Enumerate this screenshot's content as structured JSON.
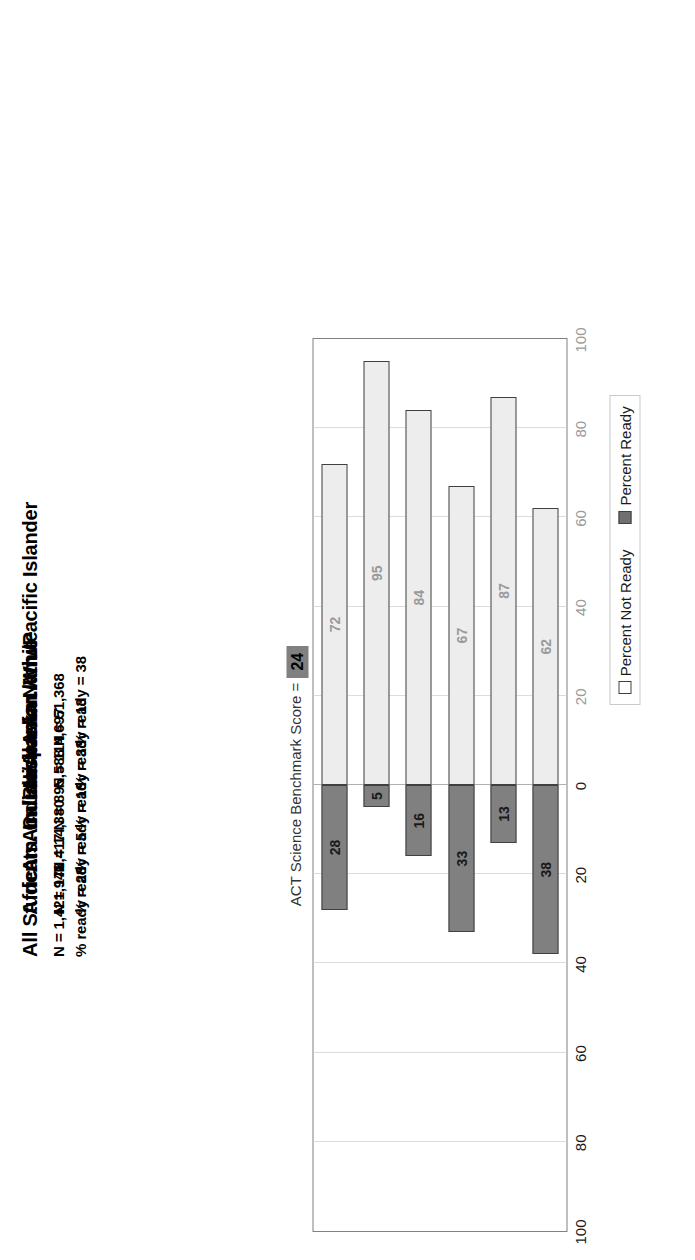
{
  "chart_title_prefix": "ACT Science Benchmark Score =",
  "benchmark_score": "24",
  "legend": {
    "not_ready": "Percent Not Ready",
    "ready": "Percent Ready"
  },
  "axis": {
    "ticks": [
      "100",
      "80",
      "60",
      "40",
      "20",
      "0",
      "20",
      "40",
      "60",
      "80",
      "100"
    ],
    "tick_values": [
      100,
      80,
      60,
      40,
      20,
      0,
      -20,
      -40,
      -60,
      -80,
      -100
    ],
    "min": -100,
    "max": 100
  },
  "groups": [
    {
      "name": "All Students",
      "n_label": "N =  1,421,941",
      "ready_label": "% ready = 28"
    },
    {
      "name": "African Am./Black",
      "n_label": "N =  178,417",
      "ready_label": "% ready = 5"
    },
    {
      "name": "Am. Indian/Alaska Native",
      "n_label": "N =  14,380",
      "ready_label": "% ready = 16"
    },
    {
      "name": "Caucasian Am./White",
      "n_label": "N =  895,588",
      "ready_label": "% ready = 33"
    },
    {
      "name": "Hispanic",
      "n_label": "N =  114,697",
      "ready_label": "% ready = 13"
    },
    {
      "name": "Asian Am./Pacific Islander",
      "n_label": "N =  51,368",
      "ready_label": "% ready = 38"
    }
  ],
  "chart_data": {
    "type": "bar",
    "xlabel": "",
    "ylabel": "Percent",
    "ylim": [
      -100,
      100
    ],
    "grid": true,
    "legend_position": "bottom-right",
    "orientation": "vertical-diverging",
    "categories": [
      "All Students",
      "African Am./Black",
      "Am. Indian/Alaska Native",
      "Caucasian Am./White",
      "Hispanic",
      "Asian Am./Pacific Islander"
    ],
    "series": [
      {
        "name": "Percent Ready",
        "values": [
          28,
          5,
          16,
          33,
          13,
          38
        ]
      },
      {
        "name": "Percent Not Ready",
        "values": [
          72,
          95,
          84,
          67,
          87,
          62
        ]
      }
    ],
    "n_values": [
      1421941,
      178417,
      14380,
      895588,
      114697,
      51368
    ],
    "annotations": [
      "ACT Science Benchmark Score = 24"
    ]
  }
}
